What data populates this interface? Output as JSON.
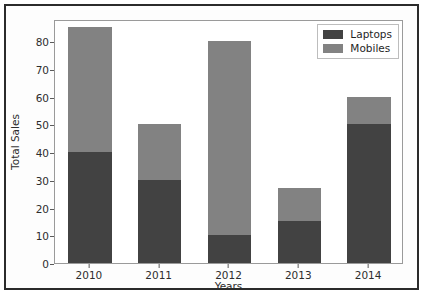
{
  "chart_data": {
    "type": "bar",
    "subtype": "stacked-bar",
    "title": "",
    "xlabel": "Years",
    "ylabel": "Total Sales",
    "categories": [
      "2010",
      "2011",
      "2012",
      "2013",
      "2014"
    ],
    "series": [
      {
        "name": "Laptops",
        "color": "#424242",
        "values": [
          40,
          30,
          10,
          15,
          50
        ]
      },
      {
        "name": "Mobiles",
        "color": "#828282",
        "values": [
          45,
          20,
          70,
          12,
          10
        ]
      }
    ],
    "totals": [
      85,
      50,
      80,
      27,
      60
    ],
    "ylim": [
      0,
      88
    ],
    "yticks": [
      0,
      10,
      20,
      30,
      40,
      50,
      60,
      70,
      80
    ],
    "ytick_labels": [
      "0",
      "10",
      "20",
      "30",
      "40",
      "50",
      "60",
      "70",
      "80"
    ],
    "xtick_labels": [
      "2010",
      "2011",
      "2012",
      "2013",
      "2014"
    ],
    "grid": false,
    "legend_position": "upper right",
    "legend_entries": [
      "Laptops",
      "Mobiles"
    ]
  },
  "figure": {
    "background_color": "#fdfdfd",
    "frame_color": "#2b2b2b",
    "axes_border_color": "#9a9a9a"
  }
}
